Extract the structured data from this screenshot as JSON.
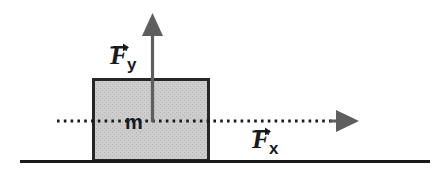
{
  "figure": {
    "background_color": "#ffffff",
    "width": 437,
    "height": 178
  },
  "block": {
    "label": "m",
    "fill_color": "#c8c8c8",
    "stroke_color": "#262626",
    "x": 93,
    "y": 79,
    "width": 116,
    "height": 82
  },
  "ground": {
    "name": "ground-line",
    "color": "#1a1a1a",
    "x1": 20,
    "x2": 430,
    "y": 161
  },
  "vectors": [
    {
      "id": "fy",
      "symbol": "F",
      "subscript": "y",
      "label": "F⃗y",
      "direction": "up",
      "color": "#555555",
      "tail_x": 152,
      "tail_y": 121,
      "tip_x": 152,
      "tip_y": 14,
      "label_x": 110,
      "label_y": 42
    },
    {
      "id": "fx",
      "symbol": "F",
      "subscript": "x",
      "label": "F⃗x",
      "direction": "right",
      "color": "#555555",
      "tail_x": 57,
      "tail_y": 121,
      "tip_x": 358,
      "tip_y": 121,
      "label_x": 252,
      "label_y": 126
    }
  ],
  "axis_line": {
    "name": "horizontal-dotted-axis",
    "style": "dotted",
    "color": "#1a1a1a",
    "x1": 57,
    "x2": 340,
    "y": 121
  }
}
